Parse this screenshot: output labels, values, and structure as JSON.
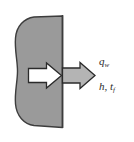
{
  "figure": {
    "name": "surface-heat-flux-boundary-condition",
    "background_color": "#ffffff",
    "width": 134,
    "height": 142
  },
  "body_region": {
    "name": "solid-body",
    "fill_color": "#9a9a9a",
    "stroke_color": "#3d3d3d",
    "description": "gray solid region with curved left boundary and straight vertical right surface"
  },
  "surface_line": {
    "name": "wall-surface",
    "color": "#3d3d3d",
    "orientation": "vertical"
  },
  "arrows": {
    "inner": {
      "name": "internal-conduction-arrow",
      "fill_color": "#ffffff",
      "stroke_color": "#2b2b2b",
      "direction": "right"
    },
    "outer": {
      "name": "surface-heat-flux-arrow",
      "fill_color": "#b4b4b4",
      "stroke_color": "#2b2b2b",
      "direction": "right"
    }
  },
  "labels": {
    "heat_flux": {
      "symbol": "q",
      "subscript": "w"
    },
    "convection": {
      "symbol_h": "h",
      "separator": ",",
      "symbol_t": "t",
      "subscript_t": "f"
    }
  }
}
